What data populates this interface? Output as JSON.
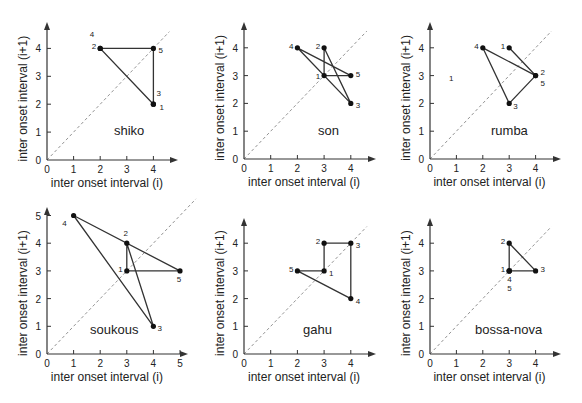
{
  "chart_data": [
    {
      "type": "scatter",
      "title": "shiko",
      "xlabel": "inter onset interval (i)",
      "ylabel": "inter onset interval (i+1)",
      "xlim": [
        0,
        4
      ],
      "ylim": [
        0,
        4
      ],
      "xticks": [
        0,
        1,
        2,
        3,
        4
      ],
      "yticks": [
        0,
        1,
        2,
        3,
        4
      ],
      "diagonal": "dashed y=x",
      "points": [
        {
          "label": "1",
          "x": 4,
          "y": 2
        },
        {
          "label": "2",
          "x": 2,
          "y": 4
        },
        {
          "label": "3",
          "x": 4,
          "y": 2
        },
        {
          "label": "4",
          "x": 2,
          "y": 4
        },
        {
          "label": "5",
          "x": 4,
          "y": 4
        }
      ],
      "closed_path": true
    },
    {
      "type": "scatter",
      "title": "son",
      "xlabel": "inter onset interval (i)",
      "ylabel": "inter onset interval (i+1)",
      "xlim": [
        0,
        4
      ],
      "ylim": [
        0,
        4
      ],
      "xticks": [
        0,
        1,
        2,
        3,
        4
      ],
      "yticks": [
        0,
        1,
        2,
        3,
        4
      ],
      "diagonal": "dashed y=x",
      "points": [
        {
          "label": "1",
          "x": 3,
          "y": 3
        },
        {
          "label": "2",
          "x": 3,
          "y": 4
        },
        {
          "label": "3",
          "x": 4,
          "y": 2
        },
        {
          "label": "4",
          "x": 2,
          "y": 4
        },
        {
          "label": "5",
          "x": 4,
          "y": 3
        }
      ],
      "closed_path": true
    },
    {
      "type": "scatter",
      "title": "rumba",
      "xlabel": "inter onset interval (i)",
      "ylabel": "inter onset interval (i+1)",
      "xlim": [
        0,
        4
      ],
      "ylim": [
        0,
        4
      ],
      "xticks": [
        0,
        1,
        2,
        3,
        4
      ],
      "yticks": [
        0,
        1,
        2,
        3,
        4
      ],
      "diagonal": "dashed y=x",
      "points": [
        {
          "label": "1",
          "x": 3,
          "y": 4
        },
        {
          "label": "2",
          "x": 4,
          "y": 3
        },
        {
          "label": "3",
          "x": 3,
          "y": 2
        },
        {
          "label": "4",
          "x": 2,
          "y": 4
        },
        {
          "label": "5",
          "x": 4,
          "y": 3
        }
      ],
      "closed_path": true,
      "annotations": [
        {
          "text": "1",
          "x": 0.8,
          "y": 2.9
        }
      ]
    },
    {
      "type": "scatter",
      "title": "soukous",
      "xlabel": "inter onset interval (i)",
      "ylabel": "inter onset interval (i+1)",
      "xlim": [
        0,
        5
      ],
      "ylim": [
        0,
        5
      ],
      "xticks": [
        0,
        1,
        2,
        3,
        4,
        5
      ],
      "yticks": [
        0,
        1,
        2,
        3,
        4,
        5
      ],
      "diagonal": "dashed y=x",
      "points": [
        {
          "label": "1",
          "x": 3,
          "y": 3
        },
        {
          "label": "2",
          "x": 3,
          "y": 4
        },
        {
          "label": "3",
          "x": 4,
          "y": 1
        },
        {
          "label": "4",
          "x": 1,
          "y": 5
        },
        {
          "label": "5",
          "x": 5,
          "y": 3
        }
      ],
      "closed_path": true
    },
    {
      "type": "scatter",
      "title": "gahu",
      "xlabel": "inter onset interval (i)",
      "ylabel": "inter onset interval (i+1)",
      "xlim": [
        0,
        4
      ],
      "ylim": [
        0,
        4
      ],
      "xticks": [
        0,
        1,
        2,
        3,
        4
      ],
      "yticks": [
        0,
        1,
        2,
        3,
        4
      ],
      "diagonal": "dashed y=x",
      "points": [
        {
          "label": "1",
          "x": 3,
          "y": 3
        },
        {
          "label": "2",
          "x": 3,
          "y": 4
        },
        {
          "label": "3",
          "x": 4,
          "y": 4
        },
        {
          "label": "4",
          "x": 4,
          "y": 2
        },
        {
          "label": "5",
          "x": 2,
          "y": 3
        }
      ],
      "closed_path": true
    },
    {
      "type": "scatter",
      "title": "bossa-nova",
      "xlabel": "inter onset interval (i)",
      "ylabel": "inter onset interval (i+1)",
      "xlim": [
        0,
        4
      ],
      "ylim": [
        0,
        4
      ],
      "xticks": [
        0,
        1,
        2,
        3,
        4
      ],
      "yticks": [
        0,
        1,
        2,
        3,
        4
      ],
      "diagonal": "dashed y=x",
      "points": [
        {
          "label": "1",
          "x": 3,
          "y": 3
        },
        {
          "label": "2",
          "x": 3,
          "y": 4
        },
        {
          "label": "3",
          "x": 4,
          "y": 3
        },
        {
          "label": "4",
          "x": 3,
          "y": 3
        },
        {
          "label": "5",
          "x": 3,
          "y": 3
        }
      ],
      "closed_path": true
    }
  ],
  "panels": [
    {
      "ox": 47,
      "oy": 160,
      "sx": 26.6,
      "sy": 27.9,
      "x_end": 178,
      "y_top": 22,
      "ymax_axis": 4.6,
      "genre_pos": [
        114,
        135
      ],
      "label_pos": {
        "1": [
          6,
          6,
          "start"
        ],
        "2": [
          -4,
          1,
          "end"
        ],
        "3": [
          3,
          -8,
          "start"
        ],
        "4": [
          -6,
          -11,
          "end"
        ],
        "5": [
          5,
          5,
          "start"
        ]
      }
    },
    {
      "ox": 244,
      "oy": 159,
      "sx": 26.7,
      "sy": 27.8,
      "x_end": 376,
      "y_top": 22,
      "ymax_axis": 4.6,
      "genre_pos": [
        318,
        135
      ],
      "label_pos": {
        "1": [
          -4,
          3,
          "end"
        ],
        "2": [
          -4,
          1,
          "end"
        ],
        "3": [
          5,
          5,
          "start"
        ],
        "4": [
          -4,
          1,
          "end"
        ],
        "5": [
          5,
          1,
          "start"
        ]
      }
    },
    {
      "ox": 430,
      "oy": 159,
      "sx": 26.4,
      "sy": 27.8,
      "x_end": 561,
      "y_top": 22,
      "ymax_axis": 4.6,
      "genre_pos": [
        491,
        135
      ],
      "label_pos": {
        "1": [
          -4,
          1,
          "end"
        ],
        "2": [
          5,
          -1,
          "start"
        ],
        "3": [
          4,
          6,
          "start"
        ],
        "4": [
          -4,
          1,
          "end"
        ],
        "5": [
          5,
          10,
          "start"
        ]
      }
    },
    {
      "ox": 47,
      "oy": 354,
      "sx": 26.6,
      "sy": 27.7,
      "x_end": 188,
      "y_top": 207,
      "ymax_axis": 5.2,
      "genre_pos": [
        90,
        334
      ],
      "label_pos": {
        "1": [
          -4,
          1,
          "end"
        ],
        "2": [
          -1,
          -7,
          "middle"
        ],
        "3": [
          4,
          5,
          "start"
        ],
        "4": [
          -7,
          10,
          "end"
        ],
        "5": [
          -1,
          11,
          "middle"
        ]
      }
    },
    {
      "ox": 244,
      "oy": 354,
      "sx": 26.7,
      "sy": 27.7,
      "x_end": 376,
      "y_top": 218,
      "ymax_axis": 4.6,
      "genre_pos": [
        303,
        334
      ],
      "label_pos": {
        "1": [
          5,
          5,
          "start"
        ],
        "2": [
          -4,
          1,
          "end"
        ],
        "3": [
          5,
          5,
          "start"
        ],
        "4": [
          5,
          5,
          "start"
        ],
        "5": [
          -4,
          1,
          "end"
        ]
      }
    },
    {
      "ox": 430,
      "oy": 354,
      "sx": 26.4,
      "sy": 27.7,
      "x_end": 561,
      "y_top": 218,
      "ymax_axis": 4.6,
      "genre_pos": [
        475,
        334
      ],
      "label_pos": {
        "1": [
          -4,
          1,
          "end"
        ],
        "2": [
          -4,
          1,
          "end"
        ],
        "3": [
          5,
          1,
          "start"
        ],
        "4": [
          -2,
          11,
          "start"
        ],
        "5": [
          -2,
          20,
          "start"
        ]
      }
    }
  ]
}
